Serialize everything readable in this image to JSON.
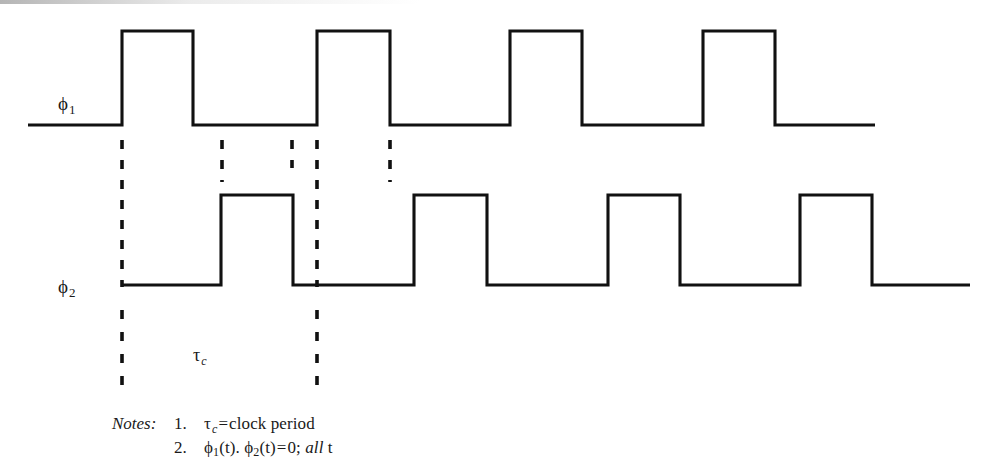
{
  "figure": {
    "type": "timing-diagram",
    "background_color": "#ffffff",
    "line_color": "#111111",
    "width": 1005,
    "height": 476
  },
  "signals": [
    {
      "id": "phi1",
      "label_base": "ϕ",
      "label_sub": "1",
      "label_x": 58,
      "label_y": 94,
      "baseline_y": 125,
      "high_y": 31,
      "start_x": 28,
      "end_x": 875,
      "pulses": [
        {
          "rise_x": 122,
          "fall_x": 193
        },
        {
          "rise_x": 317,
          "fall_x": 390
        },
        {
          "rise_x": 510,
          "fall_x": 582
        },
        {
          "rise_x": 703,
          "fall_x": 775
        }
      ]
    },
    {
      "id": "phi2",
      "label_base": "ϕ",
      "label_sub": "2",
      "label_x": 58,
      "label_y": 277,
      "baseline_y": 285,
      "high_y": 195,
      "start_x": 122,
      "end_x": 970,
      "pulses": [
        {
          "rise_x": 221,
          "fall_x": 293
        },
        {
          "rise_x": 414,
          "fall_x": 487
        },
        {
          "rise_x": 608,
          "fall_x": 680
        },
        {
          "rise_x": 800,
          "fall_x": 872
        }
      ]
    }
  ],
  "guide_lines": [
    {
      "id": "guide-edge-1",
      "x": 122,
      "y1": 140,
      "y2": 287,
      "dash": "9,11"
    },
    {
      "id": "guide-edge-2",
      "x": 222,
      "y1": 140,
      "y2": 182,
      "dash": "9,11"
    },
    {
      "id": "guide-edge-3",
      "x": 292,
      "y1": 140,
      "y2": 168,
      "dash": "9,11"
    },
    {
      "id": "guide-edge-4",
      "x": 317,
      "y1": 140,
      "y2": 287,
      "dash": "9,11"
    },
    {
      "id": "guide-edge-5",
      "x": 390,
      "y1": 140,
      "y2": 182,
      "dash": "9,11"
    },
    {
      "id": "guide-period-left",
      "x": 122,
      "y1": 310,
      "y2": 386,
      "dash": "9,13"
    },
    {
      "id": "guide-period-right",
      "x": 317,
      "y1": 310,
      "y2": 386,
      "dash": "9,13"
    }
  ],
  "period_annotation": {
    "base": "τ",
    "sub": "c",
    "x": 193,
    "y": 346,
    "meaning": "clock period"
  },
  "notes": {
    "caption": "Notes:",
    "items": [
      {
        "number": "1.",
        "lhs_base": "τ",
        "lhs_sub": "c",
        "operator": "=",
        "rhs": "clock period"
      },
      {
        "number": "2.",
        "term1_base": "ϕ",
        "term1_sub": "1",
        "term1_arg": "(t).",
        "term2_base": "ϕ",
        "term2_sub": "2",
        "term2_arg": "(t)",
        "operator": "=",
        "rhs": "0;",
        "qualifier_italic": "all",
        "qualifier_var": "t"
      }
    ]
  },
  "chart_data": {
    "type": "line",
    "xlabel": "t",
    "ylabel": "",
    "grid": false,
    "legend": "none",
    "series": [
      {
        "name": "ϕ1",
        "description": "Phase 1 clock, logic-high pulses",
        "levels": [
          0,
          1,
          0,
          1,
          0,
          1,
          0,
          1,
          0
        ],
        "transition_x": [
          28,
          122,
          193,
          317,
          390,
          510,
          582,
          703,
          775,
          875
        ]
      },
      {
        "name": "ϕ2",
        "description": "Phase 2 clock, non-overlapping with phase 1",
        "levels": [
          0,
          1,
          0,
          1,
          0,
          1,
          0,
          1,
          0
        ],
        "transition_x": [
          122,
          221,
          293,
          414,
          487,
          608,
          680,
          800,
          872,
          970
        ]
      }
    ],
    "annotations": [
      {
        "text": "τc",
        "type": "interval",
        "from_x": 122,
        "to_x": 317,
        "meaning": "clock period"
      }
    ]
  }
}
